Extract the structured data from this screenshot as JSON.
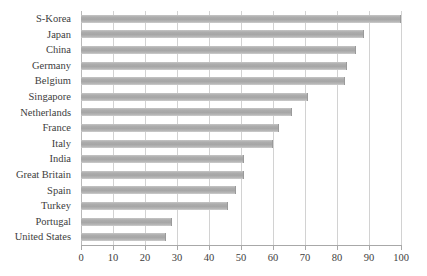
{
  "chart_data": {
    "type": "bar",
    "orientation": "horizontal",
    "title": "",
    "subtitle": "",
    "xlabel": "",
    "ylabel": "",
    "xlim": [
      0,
      100
    ],
    "xticks": [
      0,
      10,
      20,
      30,
      40,
      50,
      60,
      70,
      80,
      90,
      100
    ],
    "xtick_labels": [
      "0",
      "10",
      "20",
      "30",
      "40",
      "50",
      "60",
      "70",
      "80",
      "90",
      "100"
    ],
    "grid": "vertical",
    "legend": "none",
    "categories": [
      "S-Korea",
      "Japan",
      "China",
      "Germany",
      "Belgium",
      "Singapore",
      "Netherlands",
      "France",
      "Italy",
      "India",
      "Great Britain",
      "Spain",
      "Turkey",
      "Portugal",
      "United States"
    ],
    "values": [
      100,
      88.5,
      86,
      83,
      82.5,
      71,
      66,
      62,
      60,
      51,
      51,
      48.5,
      46,
      28.5,
      26.5
    ],
    "series": [
      {
        "name": "value",
        "values": [
          100,
          88.5,
          86,
          83,
          82.5,
          71,
          66,
          62,
          60,
          51,
          51,
          48.5,
          46,
          28.5,
          26.5
        ]
      }
    ],
    "colors": {
      "bar_fill": "#adadad",
      "bar_edge": "#9a9a9a",
      "gridline": "#d2d2d2",
      "axis": "#a8a8a8",
      "text": "#3d3d3d",
      "background": "#ffffff"
    }
  }
}
